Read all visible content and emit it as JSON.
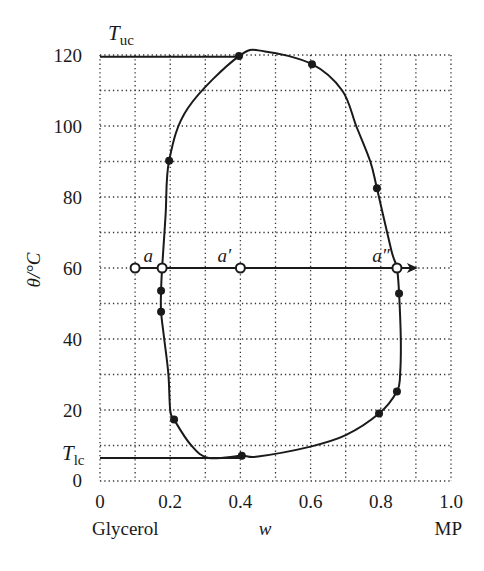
{
  "chart_data": {
    "type": "line",
    "title": "",
    "xlabel": "w",
    "ylabel": "θ/°C",
    "x_end_labels": {
      "left": "Glycerol",
      "right": "MP"
    },
    "xlim": [
      0,
      1.0
    ],
    "ylim": [
      0,
      120
    ],
    "xticks": [
      "0",
      "0.2",
      "0.4",
      "0.6",
      "0.8",
      "1.0"
    ],
    "xtick_values": [
      0,
      0.2,
      0.4,
      0.6,
      0.8,
      1.0
    ],
    "yticks": [
      "0",
      "20",
      "40",
      "60",
      "80",
      "100",
      "120"
    ],
    "ytick_values": [
      0,
      20,
      40,
      60,
      80,
      100,
      120
    ],
    "grid": {
      "on": true,
      "style": "dotted",
      "x_step": 0.1,
      "y_step": 10
    },
    "annotations": {
      "T_uc": {
        "text": "T",
        "sub": "uc",
        "value": 119.5
      },
      "T_lc": {
        "text": "T",
        "sub": "lc",
        "value": 6.5
      }
    },
    "series": [
      {
        "name": "phase boundary (closed loop)",
        "type": "curve",
        "points": [
          [
            0.211,
            17.3
          ],
          [
            0.2,
            20
          ],
          [
            0.195,
            30
          ],
          [
            0.183,
            40
          ],
          [
            0.174,
            47.7
          ],
          [
            0.174,
            53.6
          ],
          [
            0.177,
            60
          ],
          [
            0.187,
            75
          ],
          [
            0.197,
            90.2
          ],
          [
            0.25,
            105
          ],
          [
            0.396,
            119.7
          ],
          [
            0.47,
            121
          ],
          [
            0.604,
            117.4
          ],
          [
            0.69,
            110
          ],
          [
            0.73,
            100
          ],
          [
            0.77,
            90
          ],
          [
            0.789,
            82.5
          ],
          [
            0.83,
            65
          ],
          [
            0.846,
            60
          ],
          [
            0.852,
            52.8
          ],
          [
            0.857,
            40
          ],
          [
            0.855,
            30
          ],
          [
            0.846,
            25.2
          ],
          [
            0.795,
            19
          ],
          [
            0.7,
            12.9
          ],
          [
            0.6,
            9.7
          ],
          [
            0.45,
            6.9
          ],
          [
            0.404,
            7.1
          ],
          [
            0.31,
            6.5
          ],
          [
            0.26,
            10
          ],
          [
            0.211,
            17.3
          ]
        ]
      },
      {
        "name": "experimental points",
        "type": "scatter",
        "marker": "filled",
        "points": [
          [
            0.396,
            119.7
          ],
          [
            0.604,
            117.4
          ],
          [
            0.197,
            90.2
          ],
          [
            0.789,
            82.5
          ],
          [
            0.174,
            53.6
          ],
          [
            0.174,
            47.7
          ],
          [
            0.852,
            52.8
          ],
          [
            0.846,
            25.2
          ],
          [
            0.795,
            19.0
          ],
          [
            0.211,
            17.3
          ],
          [
            0.404,
            7.1
          ]
        ]
      },
      {
        "name": "tie line at 60 °C",
        "type": "arrow-line",
        "y": 60,
        "x_from": 0.1,
        "x_to": 0.9,
        "open_points": [
          {
            "x": 0.1,
            "label": ""
          },
          {
            "x": 0.177,
            "label": "a"
          },
          {
            "x": 0.4,
            "label": "a′"
          },
          {
            "x": 0.846,
            "label": "a″"
          }
        ]
      },
      {
        "name": "T_uc line",
        "type": "hline",
        "y": 119.5,
        "x_from": 0,
        "x_to": 0.396
      },
      {
        "name": "T_lc line",
        "type": "hline",
        "y": 6.5,
        "x_from": 0,
        "x_to": 0.4
      }
    ]
  }
}
